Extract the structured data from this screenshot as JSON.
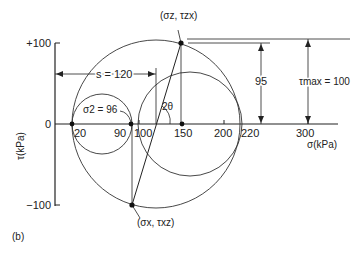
{
  "figure_label": "(b)",
  "axes": {
    "x_label": "σ(kPa)",
    "y_label": "τ(kPa)",
    "x_ticks": [
      "20",
      "90",
      "100",
      "150",
      "200",
      "220",
      "300"
    ],
    "y_ticks": [
      "+100",
      "0",
      "−100"
    ]
  },
  "annotations": {
    "point_top": "(σz, τzx)",
    "point_bottom": "(σx, τxz)",
    "s_label": "s = 120",
    "sigma2_label": "σ2 = 96",
    "angle_label": "2θ",
    "height_label": "95",
    "tau_max_label": "τmax = 100"
  },
  "circles": [
    {
      "name": "large",
      "center_sigma": 120,
      "radius": 100
    },
    {
      "name": "small",
      "center_sigma": 58,
      "radius": 38
    },
    {
      "name": "right",
      "center_sigma": 160,
      "radius": 60
    }
  ]
}
